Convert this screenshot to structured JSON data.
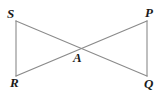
{
  "figure": {
    "background_color": "#ffffff",
    "line_color": "#8a8a8a",
    "label_color": "#1a1a1a",
    "width": 159,
    "height": 96,
    "points": {
      "S": {
        "label": "S",
        "x": 16,
        "y": 21,
        "label_x": 7,
        "label_y": 7
      },
      "P": {
        "label": "P",
        "x": 147,
        "y": 21,
        "label_x": 145,
        "label_y": 6
      },
      "R": {
        "label": "R",
        "x": 16,
        "y": 76,
        "label_x": 10,
        "label_y": 76
      },
      "Q": {
        "label": "Q",
        "x": 147,
        "y": 76,
        "label_x": 144,
        "label_y": 77
      },
      "A": {
        "label": "A",
        "x": 80,
        "y": 46,
        "label_x": 73,
        "label_y": 51
      }
    },
    "segments": [
      {
        "name": "segment-SR",
        "from": "S",
        "to": "R",
        "d": "M 16 21 L 16 76"
      },
      {
        "name": "segment-PQ",
        "from": "P",
        "to": "Q",
        "d": "M 147 21 L 147 76"
      },
      {
        "name": "segment-SQ",
        "from": "S",
        "to": "Q",
        "d": "M 16 21 L 147 76"
      },
      {
        "name": "segment-RP",
        "from": "R",
        "to": "P",
        "d": "M 16 76 L 147 21"
      }
    ]
  }
}
